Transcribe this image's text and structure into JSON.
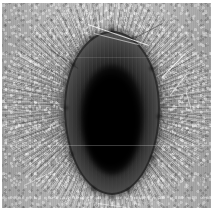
{
  "image": {
    "domain": "natural-image",
    "modality": "transmission-electron-micrograph",
    "rendering": "grayscale",
    "width_px": 217,
    "height_px": 217,
    "caption": "",
    "alt_text": "Grayscale electron micrograph of an ovoid encapsulated cell with a dense black core surrounded by a dark capsule and a halo of radiating fibres on a grainy gray background"
  },
  "background": {
    "name": "grainy-gray-field",
    "base_color": "#a8a8a8",
    "highlight_color": "#c8c8c8",
    "shadow_color": "#8a8a8a",
    "texture": "film-grain"
  },
  "border": {
    "name": "white-margin",
    "color": "#ffffff",
    "top_px": 3,
    "left_px": 2,
    "right_px": 6,
    "bottom_px": 9
  },
  "subject": {
    "name": "ovoid-cell",
    "shape": "ovoid",
    "center_x_px": 110,
    "center_y_px": 110,
    "width_px": 96,
    "height_px": 164,
    "bounds": {
      "left_px": 62,
      "top_px": 28,
      "right_px": 158,
      "bottom_px": 192
    },
    "capsule": {
      "name": "capsule-layer",
      "color": "#3a3a3a",
      "rim_color": "#121212",
      "thickness_px": 17
    },
    "core": {
      "name": "electron-dense-core",
      "color": "#000000",
      "width_px": 62,
      "height_px": 110,
      "center_x_px": 110,
      "center_y_px": 117
    },
    "fibres": {
      "name": "radiating-fibre-halo",
      "description": "fine radial striations extending outward from the capsule",
      "color": "#d8d8d8",
      "outer_radius_px": 106
    }
  },
  "artifacts": {
    "name": "imaging-artifacts",
    "streaks": [
      {
        "name": "streak-top-diagonal",
        "x_px": 88,
        "y_px": 22,
        "length_px": 62,
        "angle_deg": 19
      },
      {
        "name": "streak-upper-right-a",
        "x_px": 163,
        "y_px": 68,
        "length_px": 34,
        "angle_deg": -46
      },
      {
        "name": "streak-upper-right-b",
        "x_px": 172,
        "y_px": 84,
        "length_px": 26,
        "angle_deg": -52
      },
      {
        "name": "streak-right-edge",
        "x_px": 186,
        "y_px": 96,
        "length_px": 22,
        "angle_deg": 74
      },
      {
        "name": "streak-lower-left",
        "x_px": 28,
        "y_px": 178,
        "length_px": 30,
        "angle_deg": -28
      },
      {
        "name": "streak-bottom-center",
        "x_px": 104,
        "y_px": 200,
        "length_px": 26,
        "angle_deg": 8
      }
    ],
    "scanlines": [
      {
        "name": "scanline-mid",
        "y_px": 145,
        "intensity": 0.42
      },
      {
        "name": "scanline-upper",
        "y_px": 56,
        "intensity": 0.22
      }
    ]
  },
  "scalebar": {
    "present": false,
    "label": ""
  },
  "annotations": []
}
